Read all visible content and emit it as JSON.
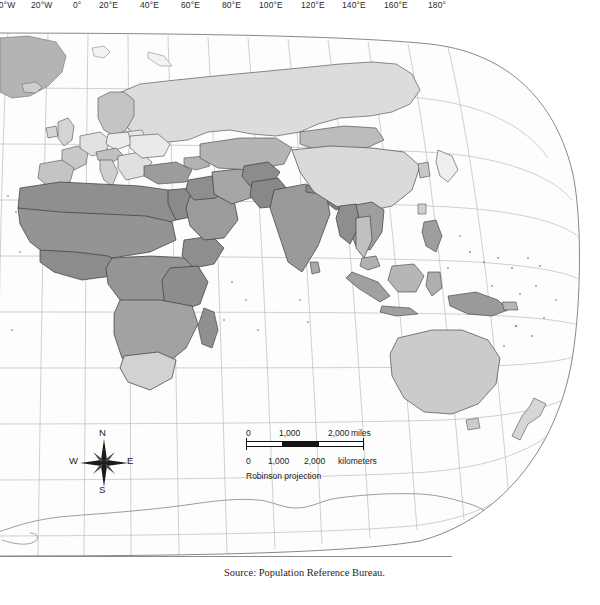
{
  "figure": {
    "type": "world-choropleth-map",
    "projection_label": "Robinson projection",
    "source_credit": "Source: Population Reference Bureau.",
    "background_color": "#ffffff",
    "graticule_color": "#b9b9b9",
    "coastline_color": "#6f6f6f",
    "border_color": "#1c1c1c"
  },
  "longitude_axis": {
    "labels": [
      {
        "text": "40°W",
        "x": 2
      },
      {
        "text": "20°W",
        "x": 37
      },
      {
        "text": "0°",
        "x": 79
      },
      {
        "text": "20°E",
        "x": 105
      },
      {
        "text": "40°E",
        "x": 145
      },
      {
        "text": "60°E",
        "x": 186
      },
      {
        "text": "80°E",
        "x": 227
      },
      {
        "text": "100°E",
        "x": 265
      },
      {
        "text": "120°E",
        "x": 307
      },
      {
        "text": "140°E",
        "x": 348
      },
      {
        "text": "160°E",
        "x": 390
      },
      {
        "text": "180°",
        "x": 434
      }
    ],
    "y": 547
  },
  "compass": {
    "north": "N",
    "south": "S",
    "east": "E",
    "west": "W"
  },
  "scale_bar": {
    "miles": {
      "ticks": [
        "0",
        "1,000",
        "2,000"
      ],
      "unit_label": "miles"
    },
    "kilometers": {
      "ticks": [
        "0",
        "1,000",
        "2,000"
      ],
      "unit_label": "kilometers"
    }
  },
  "shading_classes": [
    {
      "name": "very-dark",
      "color": "#8d8d8d"
    },
    {
      "name": "dark",
      "color": "#9d9d9d"
    },
    {
      "name": "medium",
      "color": "#b0b0b0"
    },
    {
      "name": "light",
      "color": "#c8c8c8"
    },
    {
      "name": "very-light",
      "color": "#dedede"
    },
    {
      "name": "lightest",
      "color": "#f0f0f0"
    },
    {
      "name": "no-data",
      "color": "#fcfcfc"
    }
  ]
}
